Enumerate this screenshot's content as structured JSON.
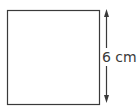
{
  "diagram": {
    "shape": "square",
    "side_label": "6 cm",
    "stroke_color": "#3a3a3a"
  }
}
